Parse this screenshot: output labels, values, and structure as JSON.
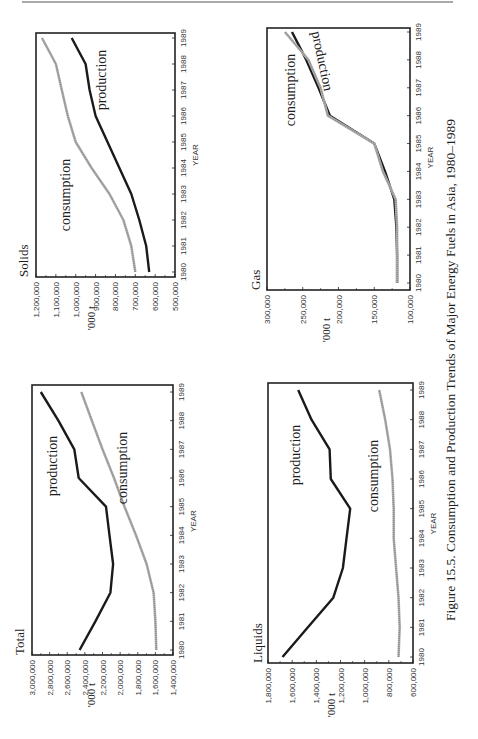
{
  "caption": "Figure 15.5. Consumption and Production Trends of Major Energy Fuels in Asia, 1980–1989",
  "chart_data": [
    {
      "id": "total",
      "type": "line",
      "title": "Total",
      "xlabel": "YEAR",
      "ylabel": "'000 t",
      "x": [
        1980,
        1981,
        1982,
        1983,
        1984,
        1985,
        1986,
        1987,
        1988,
        1989
      ],
      "ylim": [
        1400000,
        3000000
      ],
      "yticks": [
        "1,400,000",
        "1,600,000",
        "1,800,000",
        "2,000,000",
        "2,200,000",
        "2,400,000",
        "2,600,000",
        "2,800,000",
        "3,000,000"
      ],
      "ytick_values": [
        1400000,
        1600000,
        1800000,
        2000000,
        2200000,
        2400000,
        2600000,
        2800000,
        3000000
      ],
      "grid": false,
      "series": [
        {
          "name": "production",
          "style": "solid-heavy",
          "values": [
            2460000,
            2280000,
            2110000,
            2080000,
            2120000,
            2160000,
            2470000,
            2520000,
            2700000,
            2900000
          ]
        },
        {
          "name": "consumption",
          "style": "hatched-light",
          "values": [
            1590000,
            1600000,
            1620000,
            1700000,
            1820000,
            1950000,
            2070000,
            2200000,
            2320000,
            2440000
          ]
        }
      ]
    },
    {
      "id": "solids",
      "type": "line",
      "title": "Solids",
      "xlabel": "YEAR",
      "ylabel": "'000 t",
      "x": [
        1980,
        1981,
        1982,
        1983,
        1984,
        1985,
        1986,
        1987,
        1988,
        1989
      ],
      "ylim": [
        500000,
        1200000
      ],
      "yticks": [
        "500,000",
        "600,000",
        "700,000",
        "800,000",
        "900,000",
        "1,000,000",
        "1,100,000",
        "1,200,000"
      ],
      "ytick_values": [
        500000,
        600000,
        700000,
        800000,
        900000,
        1000000,
        1100000,
        1200000
      ],
      "grid": false,
      "series": [
        {
          "name": "production",
          "style": "solid-heavy",
          "values": [
            630000,
            645000,
            680000,
            720000,
            780000,
            840000,
            900000,
            930000,
            950000,
            1020000
          ]
        },
        {
          "name": "consumption",
          "style": "hatched-light",
          "values": [
            700000,
            720000,
            760000,
            830000,
            920000,
            1000000,
            1040000,
            1070000,
            1100000,
            1170000
          ]
        }
      ]
    },
    {
      "id": "liquids",
      "type": "line",
      "title": "Liquids",
      "xlabel": "YEAR",
      "ylabel": "'000 t",
      "x": [
        1980,
        1981,
        1982,
        1983,
        1984,
        1985,
        1986,
        1987,
        1988,
        1989
      ],
      "ylim": [
        600000,
        1800000
      ],
      "yticks": [
        "600,000",
        "800,000",
        "1,000,000",
        "1,200,000",
        "1,400,000",
        "1,600,000",
        "1,800,000"
      ],
      "ytick_values": [
        600000,
        800000,
        1000000,
        1200000,
        1400000,
        1600000,
        1800000
      ],
      "grid": false,
      "series": [
        {
          "name": "production",
          "style": "solid-heavy",
          "values": [
            1680000,
            1470000,
            1260000,
            1180000,
            1150000,
            1120000,
            1280000,
            1290000,
            1440000,
            1550000
          ]
        },
        {
          "name": "consumption",
          "style": "hatched-light",
          "values": [
            720000,
            710000,
            720000,
            740000,
            760000,
            760000,
            770000,
            790000,
            830000,
            880000
          ]
        }
      ]
    },
    {
      "id": "gas",
      "type": "line",
      "title": "Gas",
      "xlabel": "YEAR",
      "ylabel": "'000 t",
      "x": [
        1980,
        1981,
        1982,
        1983,
        1984,
        1985,
        1986,
        1987,
        1988,
        1989
      ],
      "ylim": [
        100000,
        300000
      ],
      "yticks": [
        "100,000",
        "150,000",
        "200,000",
        "250,000",
        "300,000"
      ],
      "ytick_values": [
        100000,
        150000,
        200000,
        250000,
        300000
      ],
      "grid": false,
      "series": [
        {
          "name": "production",
          "style": "solid-heavy",
          "values": [
            118000,
            118000,
            119000,
            122000,
            135000,
            150000,
            212000,
            228000,
            245000,
            265000
          ]
        },
        {
          "name": "consumption",
          "style": "hatched-light",
          "values": [
            118000,
            118000,
            118000,
            120000,
            138000,
            150000,
            215000,
            225000,
            242000,
            275000
          ]
        }
      ]
    }
  ],
  "colors": {
    "production": "#1a1a1a",
    "consumption": "#8a8a8a",
    "frame": "#222222",
    "rule": "#8c8c8c"
  }
}
